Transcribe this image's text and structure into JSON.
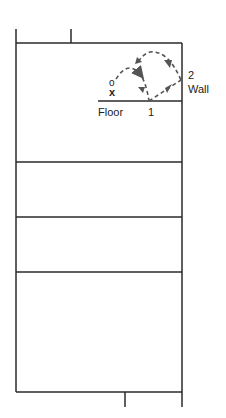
{
  "diagram": {
    "labels": {
      "floor": "Floor",
      "point1": "1",
      "point2": "2",
      "wall": "Wall",
      "marker_o": "o",
      "marker_x": "x"
    },
    "colors": {
      "line": "#2a2a2a",
      "dash": "#555555",
      "text": "#222222"
    }
  }
}
